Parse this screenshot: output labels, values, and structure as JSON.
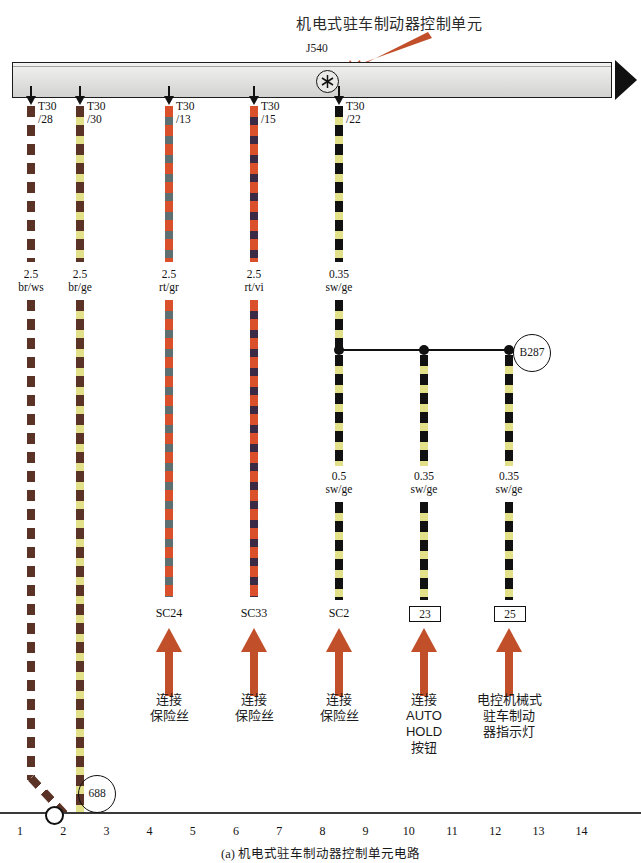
{
  "title": "机电式驻车制动器控制单元",
  "control_unit": {
    "id": "J540",
    "symbol_icon": "asterisk-in-circle-icon"
  },
  "wires": [
    {
      "index": 1,
      "x": 27,
      "terminal": "T30",
      "pin": "/28",
      "size": "2.5",
      "color_code": "br/ws",
      "c1": "#5b3226",
      "c2": "#ffffff",
      "style": "dashed",
      "bottom_label": "",
      "routes_to_ground": true
    },
    {
      "index": 2,
      "x": 76,
      "terminal": "T30",
      "pin": "/30",
      "size": "2.5",
      "color_code": "br/ge",
      "c1": "#5b3226",
      "c2": "#e3e08a",
      "style": "dashed",
      "bottom_label": "",
      "routes_to_ground": true
    },
    {
      "index": 3,
      "x": 165,
      "terminal": "T30",
      "pin": "/13",
      "size": "2.5",
      "color_code": "rt/gr",
      "c1": "#d9502b",
      "c2": "#5e6f72",
      "style": "dashed",
      "bottom_label": "SC24"
    },
    {
      "index": 4,
      "x": 250,
      "terminal": "T30",
      "pin": "/15",
      "size": "2.5",
      "color_code": "rt/vi",
      "c1": "#d9502b",
      "c2": "#3b2a45",
      "style": "dashed",
      "bottom_label": "SC33"
    },
    {
      "index": 5,
      "x": 335,
      "terminal": "T30",
      "pin": "/22",
      "size": "0.35",
      "color_code": "sw/ge",
      "c1": "#111111",
      "c2": "#e3e08a",
      "style": "dashed",
      "bottom_label": "SC2"
    }
  ],
  "splice": {
    "id": "B287",
    "branches": [
      {
        "x": 335,
        "size": "0.5",
        "color_code": "sw/ge",
        "bottom_label": "SC2",
        "label_type": "text"
      },
      {
        "x": 420,
        "size": "0.35",
        "color_code": "sw/ge",
        "bottom_label": "23",
        "label_type": "box"
      },
      {
        "x": 505,
        "size": "0.35",
        "color_code": "sw/ge",
        "bottom_label": "25",
        "label_type": "box"
      }
    ]
  },
  "destinations": [
    {
      "x": 165,
      "lines": [
        "连接",
        "保险丝"
      ]
    },
    {
      "x": 250,
      "lines": [
        "连接",
        "保险丝"
      ]
    },
    {
      "x": 335,
      "lines": [
        "连接",
        "保险丝"
      ]
    },
    {
      "x": 420,
      "lines": [
        "连接",
        "AUTO",
        "HOLD",
        "按钮"
      ]
    },
    {
      "x": 505,
      "lines": [
        "电控机械式",
        "驻车制动",
        "器指示灯"
      ]
    }
  ],
  "ground": {
    "id": "688",
    "column": 2
  },
  "axis": {
    "columns": [
      "1",
      "2",
      "3",
      "4",
      "5",
      "6",
      "7",
      "8",
      "9",
      "10",
      "11",
      "12",
      "13",
      "14"
    ]
  },
  "caption": "(a) 机电式驻车制动器控制单元电路",
  "colors": {
    "arrow_orange": "#c1502a",
    "wire_black": "#111111",
    "bar_border": "#1c1c1c"
  }
}
